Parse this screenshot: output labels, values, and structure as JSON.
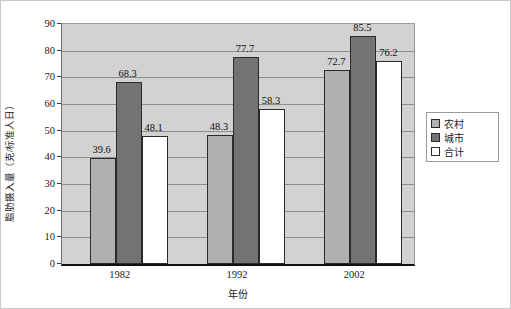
{
  "chart_data": {
    "type": "bar",
    "title": "",
    "xlabel": "年份",
    "ylabel": "脂肪摄入量（克/标准人日）",
    "categories": [
      "1982",
      "1992",
      "2002"
    ],
    "series": [
      {
        "name": "农村",
        "color": "#b0b0b0",
        "values": [
          39.6,
          48.3,
          72.7
        ]
      },
      {
        "name": "城市",
        "color": "#737373",
        "values": [
          68.3,
          77.7,
          85.5
        ]
      },
      {
        "name": "合计",
        "color": "#ffffff",
        "values": [
          48.1,
          58.3,
          76.2
        ]
      }
    ],
    "ylim": [
      0,
      90
    ],
    "ytick_step": 10,
    "yticks": [
      "90",
      "80",
      "70",
      "60",
      "50",
      "40",
      "30",
      "20",
      "10",
      "0"
    ],
    "grid": true,
    "legend_position": "right",
    "plot_background": "#d2d2d2"
  },
  "legend": {
    "items": [
      {
        "label": "农村",
        "swatch": "rural"
      },
      {
        "label": "城市",
        "swatch": "urban"
      },
      {
        "label": "合计",
        "swatch": "total"
      }
    ]
  },
  "axes": {
    "y_title": "脂肪摄入量（克/标准人日）",
    "x_title": "年份"
  }
}
